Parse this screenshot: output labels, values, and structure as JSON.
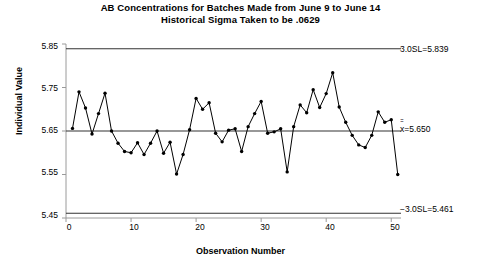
{
  "title": {
    "line1": "AB Concentrations for Batches Made from June 9 to June 14",
    "line2": "Historical Sigma Taken to be .0629"
  },
  "axes": {
    "ylabel": "Individual Value",
    "xlabel": "Observation Number",
    "yticks": [
      "5.45",
      "5.55",
      "5.65",
      "5.75",
      "5.85"
    ],
    "xticks": [
      "0",
      "10",
      "20",
      "30",
      "40",
      "50"
    ],
    "ylim": [
      5.45,
      5.85
    ],
    "xlim": [
      0,
      51.5
    ]
  },
  "limits": {
    "ucl_label": "3.0SL=5.839",
    "center_label_prefix": "x",
    "center_label_suffix": "=5.650",
    "lcl_label": "−3.0SL=5.461",
    "ucl_value": 5.839,
    "center_value": 5.65,
    "lcl_value": 5.461
  },
  "colors": {
    "line": "#000000",
    "marker": "#000000",
    "limit_line": "#000000",
    "axis": "#808080",
    "background": "#ffffff"
  },
  "chart_data": {
    "type": "line",
    "xlabel": "Observation Number",
    "ylabel": "Individual Value",
    "xlim": [
      0,
      51.5
    ],
    "ylim": [
      5.45,
      5.85
    ],
    "grid": false,
    "legend": null,
    "control_limits": {
      "upper_3sigma": 5.839,
      "center_line": 5.65,
      "lower_3sigma": 5.461,
      "sigma": 0.0629
    },
    "x": [
      1,
      2,
      3,
      4,
      5,
      6,
      7,
      8,
      9,
      10,
      11,
      12,
      13,
      14,
      15,
      16,
      17,
      18,
      19,
      20,
      21,
      22,
      23,
      24,
      25,
      26,
      27,
      28,
      29,
      30,
      31,
      32,
      33,
      34,
      35,
      36,
      37,
      38,
      39,
      40,
      41,
      42,
      43,
      44,
      45,
      46,
      47,
      48,
      49,
      50,
      51
    ],
    "series": [
      {
        "name": "Individual Value",
        "values": [
          5.656,
          5.74,
          5.703,
          5.643,
          5.69,
          5.737,
          5.65,
          5.622,
          5.603,
          5.6,
          5.623,
          5.596,
          5.622,
          5.65,
          5.599,
          5.624,
          5.551,
          5.596,
          5.653,
          5.725,
          5.7,
          5.715,
          5.645,
          5.625,
          5.652,
          5.655,
          5.603,
          5.66,
          5.69,
          5.718,
          5.645,
          5.648,
          5.655,
          5.556,
          5.66,
          5.71,
          5.692,
          5.745,
          5.704,
          5.736,
          5.784,
          5.705,
          5.67,
          5.64,
          5.618,
          5.612,
          5.64,
          5.694,
          5.67,
          5.676,
          5.55
        ]
      }
    ]
  }
}
